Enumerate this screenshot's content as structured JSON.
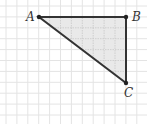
{
  "diagram": {
    "grid": {
      "origin_x": 6,
      "origin_y": 6,
      "cell": 10.9,
      "cols": 13,
      "rows": 11,
      "color": "#e4e4e4"
    },
    "points": [
      {
        "id": "A",
        "label": "A",
        "x": 39,
        "y": 17,
        "label_dx": -13,
        "label_dy": 4
      },
      {
        "id": "B",
        "label": "B",
        "x": 126,
        "y": 17,
        "label_dx": 6,
        "label_dy": 4
      },
      {
        "id": "C",
        "label": "C",
        "x": 126,
        "y": 83,
        "label_dx": -2,
        "label_dy": 14
      }
    ],
    "triangle": {
      "vertices": [
        "A",
        "B",
        "C"
      ],
      "fill": "#e9e9e9",
      "stroke": "#333333",
      "inner_grid": "#c8c8c8"
    }
  }
}
